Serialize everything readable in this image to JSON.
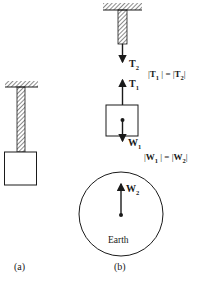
{
  "figure": {
    "panel_a": {
      "caption": "(a)"
    },
    "panel_b": {
      "caption": "(b)",
      "forces": {
        "t2": {
          "symbol": "T",
          "subscript": "2",
          "direction": "down"
        },
        "t1": {
          "symbol": "T",
          "subscript": "1",
          "direction": "up"
        },
        "w1": {
          "symbol": "W",
          "subscript": "1",
          "direction": "down"
        },
        "w2": {
          "symbol": "W",
          "subscript": "2",
          "direction": "up"
        }
      },
      "equations": {
        "tension": {
          "lhs_symbol": "T",
          "lhs_sub": "1",
          "rhs_symbol": "T",
          "rhs_sub": "2",
          "text": "|T1| = |T2|"
        },
        "weight": {
          "lhs_symbol": "W",
          "lhs_sub": "1",
          "rhs_symbol": "W",
          "rhs_sub": "2",
          "text": "|W1| = |W2|"
        }
      },
      "earth_label": "Earth"
    },
    "colors": {
      "ink": "#1a1a1a",
      "background": "#ffffff"
    }
  }
}
